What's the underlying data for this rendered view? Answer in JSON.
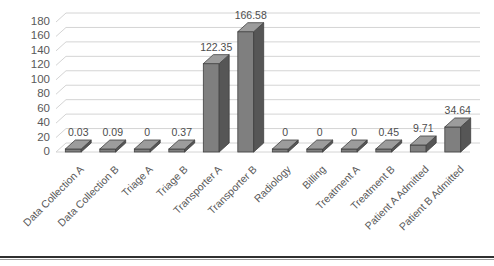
{
  "chart_data": {
    "type": "bar",
    "title": "",
    "subtitle": "",
    "xlabel": "",
    "ylabel": "",
    "ylim": [
      0,
      180
    ],
    "ytick_step": 20,
    "yticks": [
      "180",
      "160",
      "140",
      "120",
      "100",
      "80",
      "60",
      "40",
      "20",
      "0"
    ],
    "grid": true,
    "legend": "none",
    "three_d": true,
    "categories": [
      "Data Collection A",
      "Data Collection B",
      "Triage A",
      "Triage B",
      "Transporter A",
      "Transporter B",
      "Radiology",
      "Billing",
      "Treatment A",
      "Treatment B",
      "Patient A Admitted",
      "Patient B Admitted"
    ],
    "values": [
      0.03,
      0.09,
      0,
      0.37,
      122.35,
      166.58,
      0,
      0,
      0,
      0.45,
      9.71,
      34.64
    ],
    "value_labels": [
      "0.03",
      "0.09",
      "0",
      "0.37",
      "122.35",
      "166.58",
      "0",
      "0",
      "0",
      "0.45",
      "9.71",
      "34.64"
    ],
    "series": [
      {
        "name": "Series 1",
        "values": [
          0.03,
          0.09,
          0,
          0.37,
          122.35,
          166.58,
          0,
          0,
          0,
          0.45,
          9.71,
          34.64
        ]
      }
    ],
    "colors": {
      "bar_front": "#7f7f7f",
      "bar_side": "#565656",
      "bar_top": "#9c9c9c",
      "bar_outline": "#404040",
      "gridline": "#d4d4d4",
      "axis_text": "#595959",
      "label_text": "#4d4d4d",
      "plot_background": "#ffffff",
      "document_rule": "#2f2f2f"
    }
  }
}
